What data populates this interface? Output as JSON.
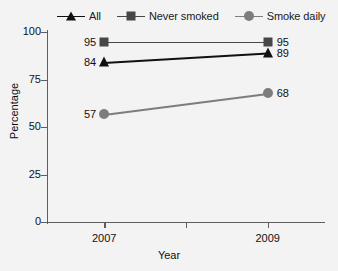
{
  "chart_data": {
    "type": "line",
    "title": "",
    "xlabel": "Year",
    "ylabel": "Percentage",
    "categories": [
      "2007",
      "2009"
    ],
    "x": [
      2007,
      2009
    ],
    "xlim": [
      2006.3,
      2009.7
    ],
    "ylim": [
      0,
      100
    ],
    "yticks": [
      0,
      25,
      50,
      75,
      100
    ],
    "ytick_labels": [
      "0",
      "25",
      "50",
      "75",
      "100"
    ],
    "xticks": [
      2007,
      2008,
      2009
    ],
    "xtick_labels": [
      "2007",
      "",
      "2009"
    ],
    "grid": false,
    "legend_position": "top",
    "series": [
      {
        "name": "All",
        "marker": "triangle",
        "color": "#111111",
        "values": [
          84,
          89
        ],
        "labels": [
          "84",
          "89"
        ]
      },
      {
        "name": "Never smoked",
        "marker": "square",
        "color": "#474747",
        "values": [
          95,
          95
        ],
        "labels": [
          "95",
          "95"
        ]
      },
      {
        "name": "Smoke daily",
        "marker": "circle",
        "color": "#7d7d7d",
        "values": [
          57,
          68
        ],
        "labels": [
          "57",
          "68"
        ]
      }
    ]
  },
  "legend": {
    "items": [
      {
        "label": "All",
        "marker": "triangle-marker",
        "color": "#111111"
      },
      {
        "label": "Never smoked",
        "marker": "square-marker",
        "color": "#474747"
      },
      {
        "label": "Smoke daily",
        "marker": "circle-marker",
        "color": "#7d7d7d"
      }
    ]
  },
  "axes": {
    "y_title": "Percentage",
    "x_title": "Year",
    "y_ticks": [
      "100",
      "75",
      "50",
      "25",
      "0"
    ],
    "x_ticks": [
      "2007",
      "2009"
    ]
  },
  "colors": {
    "background": "#f3f3f3",
    "axis": "#5e5e5e",
    "text": "#111111",
    "all_series": "#111111",
    "never_smoked_series": "#474747",
    "smoke_daily_series": "#7d7d7d"
  }
}
